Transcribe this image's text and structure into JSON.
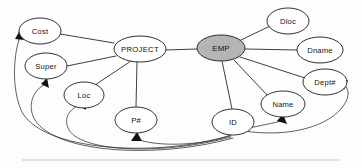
{
  "diagram": {
    "type": "entity-relationship-attribute-graph",
    "title": "",
    "background_color": "#fdfdfd",
    "line_color": "#1a1a1a",
    "entity_fill": "#b4b4b4",
    "attribute_fill": "#ffffff",
    "nodes": [
      {
        "id": "cost",
        "label": "Cost",
        "cx": 40,
        "cy": 31,
        "rx": 21,
        "ry": 13,
        "shaded": false
      },
      {
        "id": "project",
        "label": "PROJECT",
        "cx": 140,
        "cy": 49,
        "rx": 26,
        "ry": 13,
        "shaded": false
      },
      {
        "id": "dloc",
        "label": "Dloc",
        "cx": 288,
        "cy": 21,
        "rx": 21,
        "ry": 13,
        "shaded": false
      },
      {
        "id": "emp",
        "label": "EMP",
        "cx": 221,
        "cy": 48,
        "rx": 24,
        "ry": 13,
        "shaded": true
      },
      {
        "id": "dname",
        "label": "Dname",
        "cx": 320,
        "cy": 50,
        "rx": 23,
        "ry": 13,
        "shaded": false
      },
      {
        "id": "super",
        "label": "Super",
        "cx": 46,
        "cy": 66,
        "rx": 21,
        "ry": 13,
        "shaded": false
      },
      {
        "id": "deptno",
        "label": "Dept#",
        "cx": 325,
        "cy": 82,
        "rx": 22,
        "ry": 13,
        "shaded": false
      },
      {
        "id": "loc",
        "label": "Loc",
        "cx": 84,
        "cy": 95,
        "rx": 20,
        "ry": 13,
        "shaded": false
      },
      {
        "id": "name",
        "label": "Name",
        "cx": 283,
        "cy": 104,
        "rx": 22,
        "ry": 13,
        "shaded": false
      },
      {
        "id": "pnum",
        "label": "P#",
        "cx": 136,
        "cy": 120,
        "rx": 21,
        "ry": 13,
        "shaded": false
      },
      {
        "id": "id",
        "label": "ID",
        "cx": 233,
        "cy": 122,
        "rx": 21,
        "ry": 13,
        "shaded": false
      }
    ],
    "edges": [
      {
        "from": "project",
        "to": "cost",
        "style": "line"
      },
      {
        "from": "project",
        "to": "super",
        "style": "line"
      },
      {
        "from": "project",
        "to": "loc",
        "style": "line"
      },
      {
        "from": "project",
        "to": "pnum",
        "style": "line"
      },
      {
        "from": "project",
        "to": "emp",
        "style": "line"
      },
      {
        "from": "emp",
        "to": "dloc",
        "style": "line"
      },
      {
        "from": "emp",
        "to": "dname",
        "style": "line"
      },
      {
        "from": "emp",
        "to": "deptno",
        "style": "line"
      },
      {
        "from": "emp",
        "to": "name",
        "style": "line"
      },
      {
        "from": "emp",
        "to": "id",
        "style": "line"
      },
      {
        "from": "id",
        "to": "cost",
        "style": "arc",
        "arrow": true
      },
      {
        "from": "id",
        "to": "super",
        "style": "arc",
        "arrow": true
      },
      {
        "from": "id",
        "to": "loc",
        "style": "arc",
        "arrow": true
      },
      {
        "from": "id",
        "to": "pnum",
        "style": "arc",
        "arrow": true
      },
      {
        "from": "id",
        "to": "name",
        "style": "arc",
        "arrow": true
      },
      {
        "from": "id",
        "to": "deptno",
        "style": "arc",
        "arrow": true
      }
    ]
  }
}
